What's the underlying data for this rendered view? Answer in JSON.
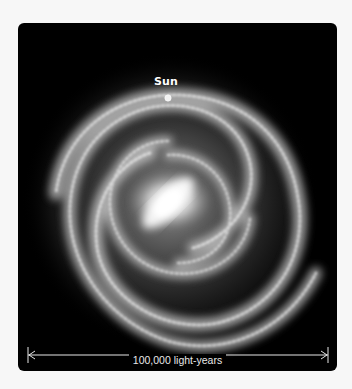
{
  "figure": {
    "sun_label": "Sun",
    "scale_bar_label": "100,000 light-years",
    "colors": {
      "background": "#f7f7f7",
      "panel": "#000000",
      "galaxy": "#ffffff",
      "text": "#ffffff"
    }
  }
}
